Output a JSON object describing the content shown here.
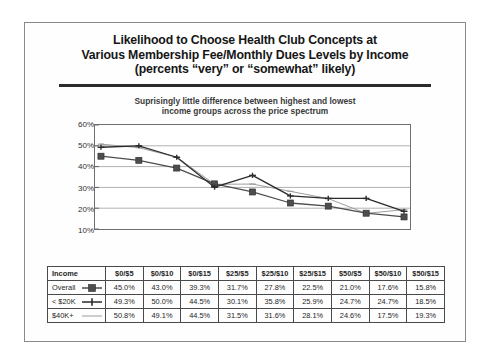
{
  "slide": {
    "title_lines": [
      "Likelihood to Choose Health Club Concepts at",
      "Various Membership Fee/Monthly Dues Levels by Income",
      "(percents “very” or “somewhat” likely)"
    ],
    "subtitle_lines": [
      "Suprisingly little difference between highest and lowest",
      "income groups across the price spectrum"
    ]
  },
  "chart_data": {
    "type": "line",
    "title": "Likelihood to Choose Health Club Concepts at Various Membership Fee/Monthly Dues Levels by Income",
    "subtitle": "Suprisingly little difference between highest and lowest income groups across the price spectrum",
    "xlabel": "",
    "ylabel": "",
    "ylim": [
      10,
      60
    ],
    "yticks": [
      "10%",
      "20%",
      "30%",
      "40%",
      "50%",
      "60%"
    ],
    "ytick_values": [
      10,
      20,
      30,
      40,
      50,
      60
    ],
    "grid": true,
    "legend_position": "table-row-labels",
    "categories": [
      "$0/$5",
      "$0/$10",
      "$0/$15",
      "$25/$5",
      "$25/$10",
      "$25/$15",
      "$50/$5",
      "$50/$10",
      "$50/$15"
    ],
    "series": [
      {
        "name": "Overall",
        "marker": "filled-square",
        "color": "#4d4d4d",
        "values": [
          45.0,
          43.0,
          39.3,
          31.7,
          27.8,
          22.5,
          21.0,
          17.6,
          15.8
        ],
        "labels": [
          "45.0%",
          "43.0%",
          "39.3%",
          "31.7%",
          "27.8%",
          "22.5%",
          "21.0%",
          "17.6%",
          "15.8%"
        ]
      },
      {
        "name": "< $20K",
        "marker": "plus-diamond",
        "color": "#2b2b2b",
        "values": [
          49.3,
          50.0,
          44.5,
          30.1,
          35.8,
          25.9,
          24.7,
          24.7,
          18.5
        ],
        "labels": [
          "49.3%",
          "50.0%",
          "44.5%",
          "30.1%",
          "35.8%",
          "25.9%",
          "24.7%",
          "24.7%",
          "18.5%"
        ]
      },
      {
        "name": "$40K+",
        "marker": "light-line",
        "color": "#9b9b9b",
        "values": [
          50.8,
          49.1,
          44.5,
          31.5,
          31.6,
          28.1,
          24.6,
          17.5,
          19.3
        ],
        "labels": [
          "50.8%",
          "49.1%",
          "44.5%",
          "31.5%",
          "31.6%",
          "28.1%",
          "24.6%",
          "17.5%",
          "19.3%"
        ]
      }
    ]
  },
  "table": {
    "header": [
      "Income",
      "$0/$5",
      "$0/$10",
      "$0/$15",
      "$25/$5",
      "$25/$10",
      "$25/$15",
      "$50/$5",
      "$50/$10",
      "$50/$15"
    ],
    "rows": [
      {
        "label": "Overall",
        "marker": "filled-square",
        "cells": [
          "45.0%",
          "43.0%",
          "39.3%",
          "31.7%",
          "27.8%",
          "22.5%",
          "21.0%",
          "17.6%",
          "15.8%"
        ]
      },
      {
        "label": "< $20K",
        "marker": "plus-diamond",
        "cells": [
          "49.3%",
          "50.0%",
          "44.5%",
          "30.1%",
          "35.8%",
          "25.9%",
          "24.7%",
          "24.7%",
          "18.5%"
        ]
      },
      {
        "label": "$40K+",
        "marker": "light-line",
        "cells": [
          "50.8%",
          "49.1%",
          "44.5%",
          "31.5%",
          "31.6%",
          "28.1%",
          "24.6%",
          "17.5%",
          "19.3%"
        ]
      }
    ]
  },
  "colors": {
    "overall": "#4d4d4d",
    "under20k": "#2b2b2b",
    "over40k": "#9b9b9b",
    "frame": "#8a8a8a",
    "rule": "#2b2b2b"
  }
}
